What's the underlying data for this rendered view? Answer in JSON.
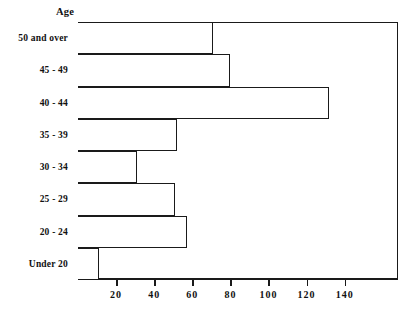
{
  "chart_data": {
    "type": "bar",
    "orientation": "horizontal",
    "title": "",
    "subtitle": "",
    "xlabel": "",
    "ylabel": "Age",
    "categories": [
      "Under 20",
      "20 - 24",
      "25 - 29",
      "30 - 34",
      "35 - 39",
      "40 - 44",
      "45 - 49",
      "50 and over"
    ],
    "values": [
      11,
      57,
      51,
      31,
      52,
      132,
      80,
      71
    ],
    "series": [
      {
        "name": "Count",
        "values": [
          11,
          57,
          51,
          31,
          52,
          132,
          80,
          71
        ]
      }
    ],
    "xlim": [
      0,
      168
    ],
    "xticks": [
      20,
      40,
      60,
      80,
      100,
      120,
      140
    ],
    "xticklabels": [
      "20",
      "40",
      "60",
      "80",
      "100",
      "120",
      "140"
    ],
    "grid": false,
    "legend": false,
    "legend_position": "none",
    "bar_fill_color": "#ffffff",
    "bar_edge_color": "#1a1a1a",
    "background_color": "#ffffff"
  },
  "axis": {
    "caption": "Age"
  }
}
